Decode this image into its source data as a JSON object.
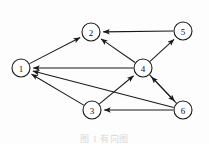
{
  "figure": {
    "caption": "图 1  有向图",
    "background_color": "#fdfdfd",
    "line_color": "#1a1a1a",
    "node_fill": "#ffffff",
    "node_radius": 9,
    "width": 209,
    "height": 144
  },
  "chart_data": {
    "type": "diagram",
    "diagram_type": "directed-graph",
    "node_count": 6,
    "edge_count": 10,
    "directed": true,
    "nodes": [
      {
        "id": "1",
        "label": "1",
        "x": 21,
        "y": 68
      },
      {
        "id": "2",
        "label": "2",
        "x": 91,
        "y": 32
      },
      {
        "id": "3",
        "label": "3",
        "x": 92,
        "y": 110
      },
      {
        "id": "4",
        "label": "4",
        "x": 143,
        "y": 68
      },
      {
        "id": "5",
        "label": "5",
        "x": 183,
        "y": 31
      },
      {
        "id": "6",
        "label": "6",
        "x": 183,
        "y": 110
      }
    ],
    "edges": [
      {
        "from": "1",
        "to": "2",
        "directed": true
      },
      {
        "from": "5",
        "to": "2",
        "directed": true
      },
      {
        "from": "4",
        "to": "2",
        "directed": true
      },
      {
        "from": "4",
        "to": "1",
        "directed": true
      },
      {
        "from": "3",
        "to": "1",
        "directed": true
      },
      {
        "from": "6",
        "to": "1",
        "directed": true
      },
      {
        "from": "3",
        "to": "4",
        "directed": true
      },
      {
        "from": "6",
        "to": "4",
        "directed": true
      },
      {
        "from": "4",
        "to": "5",
        "directed": true
      },
      {
        "from": "4",
        "to": "6",
        "directed": true
      },
      {
        "from": "6",
        "to": "3",
        "directed": true
      }
    ]
  }
}
